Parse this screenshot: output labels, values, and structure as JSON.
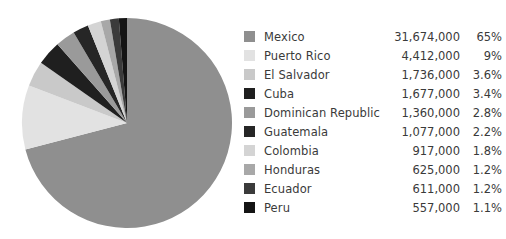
{
  "chart_data": {
    "type": "pie",
    "title": "",
    "legend_position": "right",
    "categories": [
      "Mexico",
      "Puerto Rico",
      "El Salvador",
      "Cuba",
      "Dominican Republic",
      "Guatemala",
      "Colombia",
      "Honduras",
      "Ecuador",
      "Peru"
    ],
    "values": [
      31674000,
      4412000,
      1736000,
      1677000,
      1360000,
      1077000,
      917000,
      625000,
      611000,
      557000
    ],
    "value_labels": [
      "31,674,000",
      "4,412,000",
      "1,736,000",
      "1,677,000",
      "1,360,000",
      "1,077,000",
      "917,000",
      "625,000",
      "611,000",
      "557,000"
    ],
    "percent_labels": [
      "65%",
      "9%",
      "3.6%",
      "3.4%",
      "2.8%",
      "2.2%",
      "1.8%",
      "1.2%",
      "1.2%",
      "1.1%"
    ],
    "percents": [
      65,
      9,
      3.6,
      3.4,
      2.8,
      2.2,
      1.8,
      1.2,
      1.2,
      1.1
    ],
    "colors": [
      "#8f8f8f",
      "#e2e2e2",
      "#c9c9c9",
      "#1f1f1f",
      "#9a9a9a",
      "#262626",
      "#d4d4d4",
      "#a8a8a8",
      "#3b3b3b",
      "#141414"
    ]
  },
  "legend": {
    "rows": [
      {
        "label": "Mexico",
        "value": "31,674,000",
        "percent": "65%",
        "color": "#8f8f8f"
      },
      {
        "label": "Puerto Rico",
        "value": "4,412,000",
        "percent": "9%",
        "color": "#e2e2e2"
      },
      {
        "label": "El Salvador",
        "value": "1,736,000",
        "percent": "3.6%",
        "color": "#c9c9c9"
      },
      {
        "label": "Cuba",
        "value": "1,677,000",
        "percent": "3.4%",
        "color": "#1f1f1f"
      },
      {
        "label": "Dominican Republic",
        "value": "1,360,000",
        "percent": "2.8%",
        "color": "#9a9a9a"
      },
      {
        "label": "Guatemala",
        "value": "1,077,000",
        "percent": "2.2%",
        "color": "#262626"
      },
      {
        "label": "Colombia",
        "value": "917,000",
        "percent": "1.8%",
        "color": "#d4d4d4"
      },
      {
        "label": "Honduras",
        "value": "625,000",
        "percent": "1.2%",
        "color": "#a8a8a8"
      },
      {
        "label": "Ecuador",
        "value": "611,000",
        "percent": "1.2%",
        "color": "#3b3b3b"
      },
      {
        "label": "Peru",
        "value": "557,000",
        "percent": "1.1%",
        "color": "#141414"
      }
    ]
  },
  "pie": {
    "center_x": 107,
    "center_y": 107,
    "radius": 105
  }
}
